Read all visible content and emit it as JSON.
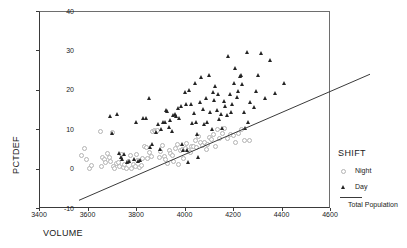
{
  "chart_data": {
    "type": "scatter",
    "title": "",
    "xlabel": "VOLUME",
    "ylabel": "PCTDEF",
    "xlim": [
      3400,
      4600
    ],
    "ylim": [
      -10,
      40
    ],
    "xticks": [
      3400,
      3600,
      3800,
      4000,
      4200,
      4400,
      4600
    ],
    "yticks": [
      -10,
      0,
      10,
      20,
      30,
      40
    ],
    "grid": false,
    "legend": {
      "title": "SHIFT",
      "position": "right",
      "entries": [
        {
          "label": "Night",
          "marker": "open-circle",
          "color": "#b3b3b3"
        },
        {
          "label": "Day",
          "marker": "filled-triangle",
          "color": "#242424"
        }
      ],
      "fit_label": "Total Population",
      "fit_color": "#3a3a3a"
    },
    "fit_line": {
      "name": "Total Population",
      "type": "linear",
      "x": [
        3400,
        4600
      ],
      "y": [
        -5.0,
        27.0
      ],
      "slope": 0.02667,
      "intercept": -95.67
    },
    "series": [
      {
        "name": "Night",
        "marker": "open-circle",
        "color": "#b3b3b3",
        "points": [
          [
            3568,
            3.6
          ],
          [
            3583,
            5.5
          ],
          [
            3590,
            2.7
          ],
          [
            3604,
            0.4
          ],
          [
            3612,
            1.2
          ],
          [
            3648,
            9.7
          ],
          [
            3650,
            0.9
          ],
          [
            3655,
            3.2
          ],
          [
            3662,
            2.6
          ],
          [
            3668,
            1.9
          ],
          [
            3676,
            4.1
          ],
          [
            3684,
            3.3
          ],
          [
            3690,
            2.2
          ],
          [
            3697,
            9.6
          ],
          [
            3700,
            1.0
          ],
          [
            3706,
            0.4
          ],
          [
            3713,
            1.7
          ],
          [
            3720,
            2.0
          ],
          [
            3727,
            0.8
          ],
          [
            3735,
            3.9
          ],
          [
            3742,
            0.6
          ],
          [
            3748,
            1.4
          ],
          [
            3755,
            0.5
          ],
          [
            3762,
            2.1
          ],
          [
            3770,
            3.8
          ],
          [
            3776,
            0.3
          ],
          [
            3783,
            1.5
          ],
          [
            3790,
            0.9
          ],
          [
            3797,
            4.0
          ],
          [
            3800,
            2.4
          ],
          [
            3808,
            0.7
          ],
          [
            3815,
            1.1
          ],
          [
            3822,
            3.0
          ],
          [
            3830,
            6.0
          ],
          [
            3836,
            5.8
          ],
          [
            3843,
            2.9
          ],
          [
            3850,
            4.5
          ],
          [
            3856,
            3.4
          ],
          [
            3862,
            9.9
          ],
          [
            3870,
            10.1
          ],
          [
            3876,
            9.8
          ],
          [
            3882,
            10.0
          ],
          [
            3890,
            3.1
          ],
          [
            3896,
            4.8
          ],
          [
            3903,
            6.2
          ],
          [
            3910,
            3.5
          ],
          [
            3917,
            2.8
          ],
          [
            3924,
            1.6
          ],
          [
            3930,
            5.1
          ],
          [
            3937,
            4.2
          ],
          [
            3943,
            3.7
          ],
          [
            3950,
            2.3
          ],
          [
            3957,
            5.4
          ],
          [
            3963,
            6.4
          ],
          [
            3970,
            1.3
          ],
          [
            3977,
            4.9
          ],
          [
            3984,
            5.2
          ],
          [
            3990,
            3.0
          ],
          [
            3997,
            5.6
          ],
          [
            4004,
            6.8
          ],
          [
            4010,
            5.0
          ],
          [
            4017,
            4.4
          ],
          [
            4024,
            6.1
          ],
          [
            4030,
            5.9
          ],
          [
            4038,
            7.4
          ],
          [
            4045,
            5.7
          ],
          [
            4052,
            8.6
          ],
          [
            4060,
            6.9
          ],
          [
            4068,
            6.3
          ],
          [
            4075,
            7.1
          ],
          [
            4083,
            5.3
          ],
          [
            4090,
            6.6
          ],
          [
            4098,
            8.2
          ],
          [
            4105,
            7.8
          ],
          [
            4112,
            9.1
          ],
          [
            4120,
            6.0
          ],
          [
            4130,
            10.2
          ],
          [
            4140,
            8.0
          ],
          [
            4150,
            9.4
          ],
          [
            4160,
            10.5
          ],
          [
            4170,
            7.9
          ],
          [
            4182,
            9.0
          ],
          [
            4195,
            8.8
          ],
          [
            4205,
            7.0
          ],
          [
            4218,
            9.2
          ],
          [
            4228,
            10.4
          ],
          [
            4240,
            7.5
          ],
          [
            4262,
            7.4
          ]
        ]
      },
      {
        "name": "Day",
        "marker": "filled-triangle",
        "color": "#242424",
        "points": [
          [
            3690,
            13.5
          ],
          [
            3700,
            9.2
          ],
          [
            3722,
            13.9
          ],
          [
            3730,
            4.1
          ],
          [
            3736,
            3.2
          ],
          [
            3742,
            2.6
          ],
          [
            3748,
            3.8
          ],
          [
            3760,
            1.9
          ],
          [
            3770,
            2.2
          ],
          [
            3790,
            2.5
          ],
          [
            3800,
            12.0
          ],
          [
            3806,
            2.0
          ],
          [
            3815,
            2.4
          ],
          [
            3828,
            12.9
          ],
          [
            3840,
            13.0
          ],
          [
            3852,
            18.0
          ],
          [
            3858,
            5.6
          ],
          [
            3866,
            6.5
          ],
          [
            3880,
            9.5
          ],
          [
            3890,
            11.5
          ],
          [
            3896,
            5.2
          ],
          [
            3903,
            10.3
          ],
          [
            3910,
            12.0
          ],
          [
            3916,
            11.9
          ],
          [
            3922,
            15.0
          ],
          [
            3928,
            14.8
          ],
          [
            3934,
            10.8
          ],
          [
            3940,
            12.6
          ],
          [
            3946,
            9.6
          ],
          [
            3952,
            13.8
          ],
          [
            3958,
            14.0
          ],
          [
            3963,
            13.5
          ],
          [
            3970,
            15.5
          ],
          [
            3976,
            13.0
          ],
          [
            3982,
            16.0
          ],
          [
            3988,
            6.5
          ],
          [
            3994,
            5.0
          ],
          [
            4000,
            19.5
          ],
          [
            4004,
            16.6
          ],
          [
            4008,
            4.8
          ],
          [
            4012,
            1.9
          ],
          [
            4018,
            20.0
          ],
          [
            4024,
            16.5
          ],
          [
            4030,
            11.8
          ],
          [
            4036,
            14.2
          ],
          [
            4042,
            22.0
          ],
          [
            4046,
            12.0
          ],
          [
            4050,
            9.0
          ],
          [
            4056,
            3.0
          ],
          [
            4062,
            17.0
          ],
          [
            4068,
            23.5
          ],
          [
            4074,
            15.4
          ],
          [
            4080,
            11.5
          ],
          [
            4086,
            18.0
          ],
          [
            4092,
            12.0
          ],
          [
            4098,
            23.8
          ],
          [
            4104,
            14.6
          ],
          [
            4110,
            10.2
          ],
          [
            4116,
            19.5
          ],
          [
            4120,
            17.6
          ],
          [
            4126,
            21.0
          ],
          [
            4132,
            15.0
          ],
          [
            4138,
            19.0
          ],
          [
            4142,
            12.8
          ],
          [
            4148,
            14.0
          ],
          [
            4154,
            10.5
          ],
          [
            4160,
            17.4
          ],
          [
            4166,
            16.0
          ],
          [
            4172,
            13.8
          ],
          [
            4178,
            28.8
          ],
          [
            4184,
            19.0
          ],
          [
            4190,
            14.6
          ],
          [
            4196,
            16.5
          ],
          [
            4202,
            22.0
          ],
          [
            4208,
            25.8
          ],
          [
            4214,
            18.2
          ],
          [
            4220,
            19.8
          ],
          [
            4226,
            23.6
          ],
          [
            4230,
            23.9
          ],
          [
            4236,
            21.5
          ],
          [
            4242,
            14.4
          ],
          [
            4248,
            10.5
          ],
          [
            4256,
            29.7
          ],
          [
            4262,
            12.0
          ],
          [
            4268,
            17.0
          ],
          [
            4284,
            15.7
          ],
          [
            4292,
            19.8
          ],
          [
            4300,
            24.0
          ],
          [
            4312,
            29.4
          ],
          [
            4330,
            18.0
          ],
          [
            4352,
            27.8
          ],
          [
            4372,
            19.4
          ],
          [
            4408,
            21.8
          ]
        ]
      }
    ]
  }
}
